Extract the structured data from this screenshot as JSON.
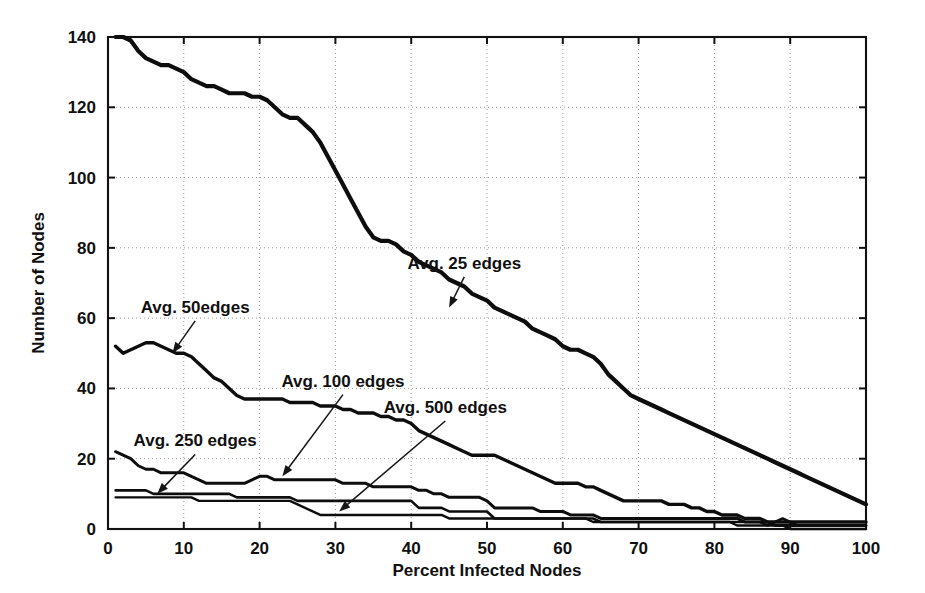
{
  "chart_data": {
    "type": "line",
    "title": "",
    "xlabel": "Percent Infected Nodes",
    "ylabel": "Number of Nodes",
    "xlim": [
      0,
      100
    ],
    "ylim": [
      0,
      140
    ],
    "xticks": [
      0,
      10,
      20,
      30,
      40,
      50,
      60,
      70,
      80,
      90,
      100
    ],
    "yticks": [
      0,
      20,
      40,
      60,
      80,
      100,
      120,
      140
    ],
    "xtick_labels": [
      "0",
      "10",
      "20",
      "30",
      "40",
      "50",
      "60",
      "70",
      "80",
      "90",
      "100"
    ],
    "ytick_labels": [
      "0",
      "20",
      "40",
      "60",
      "80",
      "100",
      "120",
      "140"
    ],
    "grid": true,
    "grid_style": "dotted",
    "legend": "none (in-plot annotations with arrows)",
    "line_color": "#0d0d0d",
    "background": "#ffffff",
    "annotations": [
      {
        "label": "Avg. 25 edges",
        "text_x": 47.0,
        "text_y": 74.0,
        "point_x": 45.0,
        "point_y": 63.0
      },
      {
        "label": "Avg. 50edges",
        "text_x": 11.5,
        "text_y": 61.5,
        "point_x": 8.5,
        "point_y": 50.0
      },
      {
        "label": "Avg. 100 edges",
        "text_x": 31.0,
        "text_y": 40.5,
        "point_x": 23.0,
        "point_y": 15.0
      },
      {
        "label": "Avg. 500 edges",
        "text_x": 44.5,
        "text_y": 33.0,
        "point_x": 30.5,
        "point_y": 5.0
      },
      {
        "label": "Avg. 250 edges",
        "text_x": 11.5,
        "text_y": 23.5,
        "point_x": 6.5,
        "point_y": 10.0
      }
    ],
    "series": [
      {
        "name": "Avg. 25 edges",
        "x": [
          1,
          2,
          3,
          4,
          5,
          6,
          7,
          8,
          9,
          10,
          11,
          12,
          13,
          14,
          15,
          16,
          17,
          18,
          19,
          20,
          21,
          22,
          23,
          24,
          25,
          26,
          27,
          28,
          29,
          30,
          31,
          32,
          33,
          34,
          35,
          36,
          37,
          38,
          39,
          40,
          41,
          42,
          43,
          44,
          45,
          46,
          47,
          48,
          49,
          50,
          51,
          52,
          53,
          54,
          55,
          56,
          57,
          58,
          59,
          60,
          61,
          62,
          63,
          64,
          65,
          66,
          67,
          68,
          69,
          70,
          71,
          72,
          73,
          74,
          75,
          76,
          77,
          78,
          79,
          80,
          81,
          82,
          83,
          84,
          85,
          86,
          87,
          88,
          89,
          90,
          91,
          92,
          93,
          94,
          95,
          96,
          97,
          98,
          99,
          100
        ],
        "values": [
          140,
          140,
          139,
          136,
          134,
          133,
          132,
          132,
          131,
          130,
          128,
          127,
          126,
          126,
          125,
          124,
          124,
          124,
          123,
          123,
          122,
          120,
          118,
          117,
          117,
          115,
          113,
          110,
          106,
          102,
          98,
          94,
          90,
          86,
          83,
          82,
          82,
          81,
          79,
          78,
          76,
          75,
          74,
          73,
          71,
          70,
          69,
          67,
          66,
          65,
          63,
          62,
          61,
          60,
          59,
          57,
          56,
          55,
          54,
          52,
          51,
          51,
          50,
          49,
          47,
          44,
          42,
          40,
          38,
          37,
          36,
          35,
          34,
          33,
          32,
          31,
          30,
          29,
          28,
          27,
          26,
          25,
          24,
          23,
          22,
          21,
          20,
          19,
          18,
          17,
          16,
          15,
          14,
          13,
          12,
          11,
          10,
          9,
          8,
          7
        ]
      },
      {
        "name": "Avg. 50edges",
        "x": [
          1,
          2,
          3,
          4,
          5,
          6,
          7,
          8,
          9,
          10,
          11,
          12,
          13,
          14,
          15,
          16,
          17,
          18,
          19,
          20,
          21,
          22,
          23,
          24,
          25,
          26,
          27,
          28,
          29,
          30,
          31,
          32,
          33,
          34,
          35,
          36,
          37,
          38,
          39,
          40,
          41,
          42,
          43,
          44,
          45,
          46,
          47,
          48,
          49,
          50,
          51,
          52,
          53,
          54,
          55,
          56,
          57,
          58,
          59,
          60,
          61,
          62,
          63,
          64,
          65,
          66,
          67,
          68,
          69,
          70,
          71,
          72,
          73,
          74,
          75,
          76,
          77,
          78,
          79,
          80,
          81,
          82,
          83,
          84,
          85,
          86,
          87,
          88,
          89,
          90,
          91,
          92,
          93,
          94,
          95,
          96,
          97,
          98,
          99,
          100
        ],
        "values": [
          52,
          50,
          51,
          52,
          53,
          53,
          52,
          51,
          50,
          50,
          49,
          47,
          45,
          43,
          42,
          40,
          38,
          37,
          37,
          37,
          37,
          37,
          37,
          36,
          36,
          36,
          36,
          35,
          35,
          35,
          34,
          34,
          33,
          33,
          33,
          32,
          32,
          31,
          31,
          30,
          28,
          27,
          26,
          25,
          24,
          23,
          22,
          21,
          21,
          21,
          21,
          20,
          19,
          18,
          17,
          16,
          15,
          14,
          13,
          13,
          13,
          13,
          12,
          12,
          11,
          10,
          9,
          8,
          8,
          8,
          8,
          8,
          8,
          7,
          7,
          7,
          6,
          6,
          5,
          5,
          4,
          4,
          4,
          3,
          3,
          3,
          2,
          2,
          2,
          2,
          2,
          2,
          2,
          2,
          2,
          2,
          2,
          2,
          2,
          2
        ]
      },
      {
        "name": "Avg. 100 edges",
        "x": [
          1,
          2,
          3,
          4,
          5,
          6,
          7,
          8,
          9,
          10,
          11,
          12,
          13,
          14,
          15,
          16,
          17,
          18,
          19,
          20,
          21,
          22,
          23,
          24,
          25,
          26,
          27,
          28,
          29,
          30,
          31,
          32,
          33,
          34,
          35,
          36,
          37,
          38,
          39,
          40,
          41,
          42,
          43,
          44,
          45,
          46,
          47,
          48,
          49,
          50,
          51,
          52,
          53,
          54,
          55,
          56,
          57,
          58,
          59,
          60,
          61,
          62,
          63,
          64,
          65,
          66,
          67,
          68,
          69,
          70,
          71,
          72,
          73,
          74,
          75,
          76,
          77,
          78,
          79,
          80,
          81,
          82,
          83,
          84,
          85,
          86,
          87,
          88,
          89,
          90,
          91,
          92,
          93,
          94,
          95,
          96,
          97,
          98,
          99,
          100
        ],
        "values": [
          22,
          21,
          20,
          18,
          17,
          17,
          16,
          16,
          16,
          16,
          15,
          14,
          13,
          13,
          13,
          13,
          13,
          13,
          14,
          15,
          15,
          14,
          14,
          14,
          14,
          14,
          14,
          14,
          14,
          14,
          13,
          13,
          13,
          13,
          12,
          12,
          12,
          12,
          12,
          12,
          11,
          11,
          10,
          10,
          9,
          9,
          9,
          9,
          9,
          8,
          6,
          6,
          6,
          6,
          6,
          6,
          5,
          5,
          5,
          5,
          4,
          4,
          4,
          4,
          3,
          3,
          3,
          3,
          3,
          3,
          3,
          3,
          3,
          3,
          3,
          3,
          3,
          3,
          3,
          3,
          3,
          3,
          3,
          2,
          2,
          2,
          2,
          1,
          1,
          1,
          1,
          1,
          1,
          1,
          1,
          1,
          1,
          1,
          1,
          1
        ]
      },
      {
        "name": "Avg. 250 edges",
        "x": [
          1,
          2,
          3,
          4,
          5,
          6,
          7,
          8,
          9,
          10,
          11,
          12,
          13,
          14,
          15,
          16,
          17,
          18,
          19,
          20,
          21,
          22,
          23,
          24,
          25,
          26,
          27,
          28,
          29,
          30,
          31,
          32,
          33,
          34,
          35,
          36,
          37,
          38,
          39,
          40,
          41,
          42,
          43,
          44,
          45,
          46,
          47,
          48,
          49,
          50,
          51,
          52,
          53,
          54,
          55,
          56,
          57,
          58,
          59,
          60,
          61,
          62,
          63,
          64,
          65,
          66,
          67,
          68,
          69,
          70,
          71,
          72,
          73,
          74,
          75,
          76,
          77,
          78,
          79,
          80,
          81,
          82,
          83,
          84,
          85,
          86,
          87,
          88,
          89,
          90,
          91,
          92,
          93,
          94,
          95,
          96,
          97,
          98,
          99,
          100
        ],
        "values": [
          11,
          11,
          11,
          11,
          11,
          10,
          10,
          10,
          10,
          10,
          10,
          10,
          10,
          10,
          10,
          10,
          9,
          9,
          9,
          9,
          9,
          9,
          9,
          9,
          8,
          8,
          8,
          8,
          8,
          8,
          8,
          8,
          8,
          8,
          8,
          8,
          8,
          8,
          8,
          8,
          6,
          6,
          6,
          6,
          5,
          5,
          5,
          5,
          5,
          5,
          3,
          3,
          3,
          3,
          3,
          3,
          3,
          3,
          3,
          3,
          3,
          3,
          3,
          3,
          2,
          2,
          2,
          2,
          2,
          2,
          2,
          2,
          2,
          2,
          2,
          2,
          2,
          2,
          2,
          2,
          2,
          2,
          2,
          2,
          2,
          2,
          1,
          2,
          3,
          2,
          1,
          1,
          1,
          1,
          1,
          1,
          1,
          1,
          1,
          1
        ]
      },
      {
        "name": "Avg. 500 edges",
        "x": [
          1,
          2,
          3,
          4,
          5,
          6,
          7,
          8,
          9,
          10,
          11,
          12,
          13,
          14,
          15,
          16,
          17,
          18,
          19,
          20,
          21,
          22,
          23,
          24,
          25,
          26,
          27,
          28,
          29,
          30,
          31,
          32,
          33,
          34,
          35,
          36,
          37,
          38,
          39,
          40,
          41,
          42,
          43,
          44,
          45,
          46,
          47,
          48,
          49,
          50,
          51,
          52,
          53,
          54,
          55,
          56,
          57,
          58,
          59,
          60,
          61,
          62,
          63,
          64,
          65,
          66,
          67,
          68,
          69,
          70,
          71,
          72,
          73,
          74,
          75,
          76,
          77,
          78,
          79,
          80,
          81,
          82,
          83,
          84,
          85,
          86,
          87,
          88,
          89,
          90,
          91,
          92,
          93,
          94,
          95,
          96,
          97,
          98,
          99,
          100
        ],
        "values": [
          9,
          9,
          9,
          9,
          9,
          9,
          9,
          9,
          9,
          9,
          9,
          8,
          8,
          8,
          8,
          8,
          8,
          8,
          8,
          8,
          8,
          8,
          8,
          8,
          7,
          6,
          5,
          4,
          4,
          4,
          4,
          4,
          4,
          4,
          4,
          4,
          4,
          4,
          4,
          4,
          4,
          4,
          4,
          4,
          3,
          3,
          3,
          3,
          3,
          3,
          3,
          3,
          3,
          3,
          3,
          3,
          3,
          3,
          3,
          3,
          3,
          3,
          3,
          2,
          2,
          2,
          2,
          2,
          2,
          2,
          2,
          2,
          2,
          2,
          2,
          2,
          2,
          2,
          2,
          2,
          2,
          2,
          1,
          1,
          1,
          1,
          1,
          1,
          1,
          0,
          0,
          0,
          0,
          0,
          0,
          0,
          0,
          0,
          0,
          0
        ]
      }
    ]
  }
}
